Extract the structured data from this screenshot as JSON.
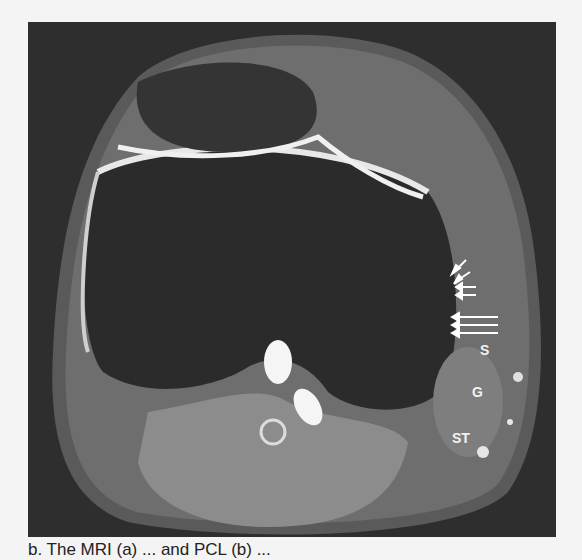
{
  "figure": {
    "labels": [
      {
        "text": "S",
        "x": 452,
        "y": 330
      },
      {
        "text": "G",
        "x": 444,
        "y": 372
      },
      {
        "text": "ST",
        "x": 426,
        "y": 418
      }
    ],
    "arrows_count": 8,
    "colors": {
      "background": "#2e2e2e",
      "page": "#f4f4f4",
      "bright_fluid": "#f0f0f0",
      "soft_tissue": "#7a7a7a"
    }
  },
  "caption": {
    "text": "b. The MRI (a) ... and PCL (b) ..."
  }
}
